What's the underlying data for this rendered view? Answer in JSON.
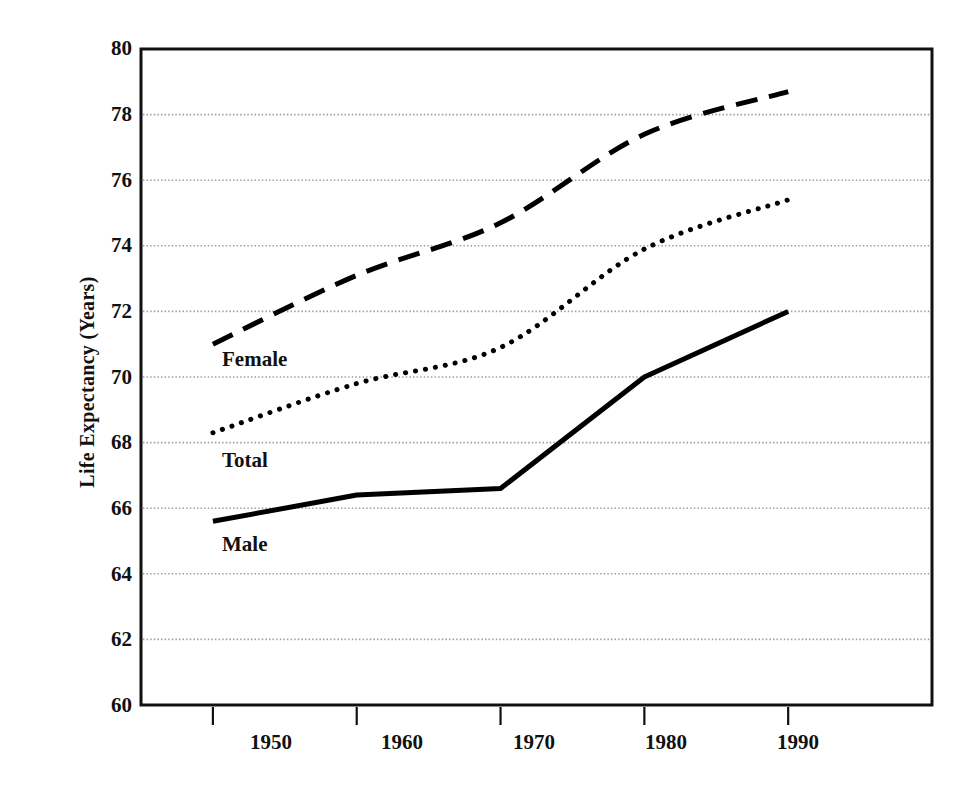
{
  "chart_data": {
    "type": "line",
    "title": "",
    "xlabel": "",
    "ylabel": "Life Expectancy (Years)",
    "xlim": [
      1945,
      2000
    ],
    "ylim": [
      60,
      80
    ],
    "grid": true,
    "gridlines_y": [
      62,
      64,
      66,
      68,
      70,
      72,
      74,
      76,
      78
    ],
    "yticks": [
      60,
      62,
      64,
      66,
      68,
      70,
      72,
      74,
      76,
      78,
      80
    ],
    "ytick_labels": [
      "60",
      "62",
      "64",
      "66",
      "68",
      "70",
      "72",
      "74",
      "76",
      "78",
      "80"
    ],
    "xticks": [
      1950,
      1960,
      1970,
      1980,
      1990
    ],
    "xtick_labels": [
      "1950",
      "1960",
      "1970",
      "1980",
      "1990"
    ],
    "legend_position": "inline-annotations",
    "x": [
      1950,
      1960,
      1970,
      1980,
      1990
    ],
    "series": [
      {
        "name": "Female",
        "style": "dashed",
        "color": "#000000",
        "label_text": "Female",
        "values": [
          71.0,
          73.1,
          74.7,
          77.4,
          78.7
        ]
      },
      {
        "name": "Total",
        "style": "dotted",
        "color": "#000000",
        "label_text": "Total",
        "values": [
          68.3,
          69.8,
          70.9,
          73.9,
          75.4
        ]
      },
      {
        "name": "Male",
        "style": "solid",
        "color": "#000000",
        "label_text": "Male",
        "values": [
          65.6,
          66.4,
          66.6,
          70.0,
          72.0
        ]
      }
    ],
    "annotations": [
      {
        "text": "Female",
        "x": 1950.6,
        "y": 70.55
      },
      {
        "text": "Total",
        "x": 1950.6,
        "y": 67.6
      },
      {
        "text": "Male",
        "x": 1950.6,
        "y": 65.0
      }
    ]
  },
  "axes": {
    "y_title": "Life Expectancy (Years)",
    "y_ticks": [
      "80",
      "78",
      "76",
      "74",
      "72",
      "70",
      "68",
      "66",
      "64",
      "62",
      "60"
    ],
    "x_ticks": [
      "1950",
      "1960",
      "1970",
      "1980",
      "1990"
    ]
  },
  "series_labels": {
    "female": "Female",
    "total": "Total",
    "male": "Male"
  },
  "colors": {
    "ink": "#111111",
    "grid": "#9a9a9a",
    "background": "#ffffff"
  }
}
